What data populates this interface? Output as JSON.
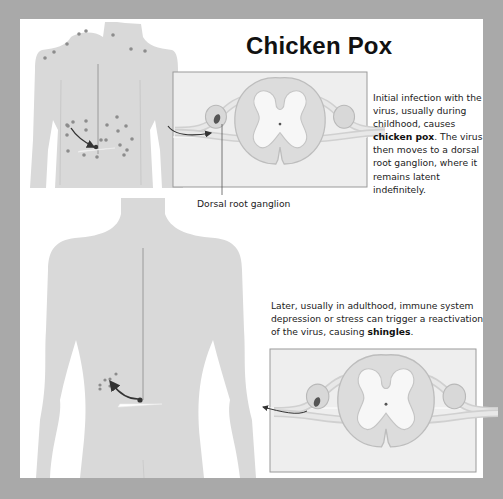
{
  "title": "Chicken Pox",
  "captions": {
    "initial": {
      "before": "Initial infection with the virus, usually during childhood, causes ",
      "bold": "chicken pox",
      "after": ". The virus then moves to a dorsal root ganglion, where it remains latent indefinitely."
    },
    "reactivation": {
      "before": "Later, usually in adulthood, immune system depression or stress can trigger a reactivation of the virus, causing ",
      "bold": "shingles",
      "after": "."
    }
  },
  "labels": {
    "ganglion": "Dorsal root ganglion"
  },
  "figures": {
    "top_body": "back-view torso with scattered chicken pox spots and arrow from spinal nerve to spots",
    "top_spinal_cord": "spinal cord cross-section with virus entering dorsal root ganglion",
    "bottom_body": "back-view torso with localized shingles cluster and arrow from spinal nerve outward",
    "bottom_spinal_cord": "spinal cord cross-section with virus leaving dorsal root ganglion"
  },
  "colors": {
    "frame": "#a9a9a9",
    "panel": "#ffffff",
    "body": "#d9d9d9",
    "cord": "#dcdcdc",
    "grey_matter": "#f6f6f6",
    "box_bg": "#eeeeee",
    "box_border": "#9a9a9a",
    "spot": "#8c8c8c",
    "arrow": "#333333",
    "text": "#222222"
  }
}
